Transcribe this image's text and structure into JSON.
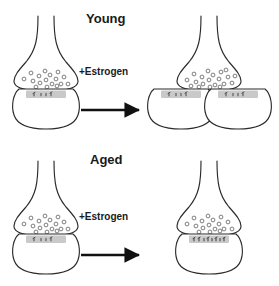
{
  "figure": {
    "title_young": "Young",
    "title_aged": "Aged",
    "treatment_label": "+Estrogen",
    "colors": {
      "outline": "#2b2b2b",
      "vesicle_stroke": "#555555",
      "psd_fill": "#c9c9c9",
      "psd_mark": "#3a3a3a",
      "arrow": "#111111",
      "text": "#1a1a1a",
      "background": "#ffffff"
    },
    "rows": [
      {
        "name": "young",
        "title": "Young",
        "treatment": "+Estrogen",
        "before": {
          "terminals": 1,
          "spines": 1,
          "vesicle_count": 17,
          "psd_marks": 4,
          "psd_density": "sparse"
        },
        "after": {
          "terminals": 1,
          "spines": 2,
          "vesicle_count": 20,
          "psd_marks": 4,
          "psd_density": "sparse"
        }
      },
      {
        "name": "aged",
        "title": "Aged",
        "treatment": "+Estrogen",
        "before": {
          "terminals": 1,
          "spines": 1,
          "vesicle_count": 17,
          "psd_marks": 4,
          "psd_density": "sparse"
        },
        "after": {
          "terminals": 1,
          "spines": 1,
          "vesicle_count": 17,
          "psd_marks": 9,
          "psd_density": "dense"
        }
      }
    ]
  }
}
